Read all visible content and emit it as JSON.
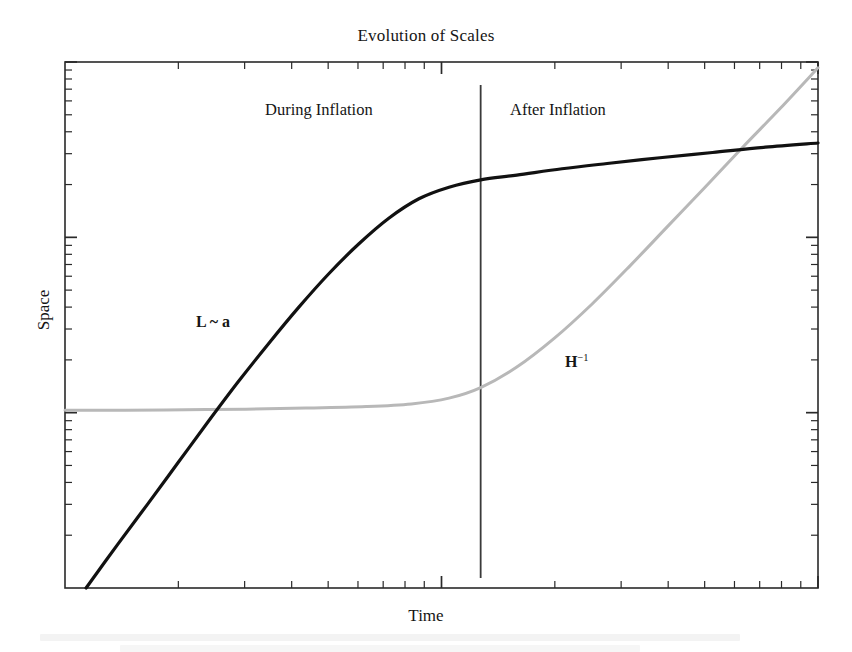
{
  "figure": {
    "title": "Evolution of Scales",
    "xlabel": "Time",
    "ylabel": "Space",
    "region_left_label": "During Inflation",
    "region_right_label": "After Inflation",
    "curve_label_scale": "L ~ a",
    "curve_label_hubble_base": "H",
    "curve_label_hubble_exponent": "−1"
  },
  "chart_data": {
    "type": "line",
    "title": "Evolution of Scales",
    "xlabel": "Time",
    "ylabel": "Space",
    "grid": false,
    "legend": "none",
    "xscale": "log",
    "yscale": "log",
    "xlim": [
      0,
      1
    ],
    "ylim": [
      0,
      1
    ],
    "axis_tick_labels": [],
    "annotations": [
      {
        "text": "During Inflation",
        "x": 0.28,
        "y": 0.93
      },
      {
        "text": "After Inflation",
        "x": 0.62,
        "y": 0.93
      },
      {
        "text": "L ~ a",
        "x": 0.19,
        "y": 0.53
      },
      {
        "text": "H−1",
        "x": 0.68,
        "y": 0.45
      }
    ],
    "reference_lines": [
      {
        "orientation": "vertical",
        "x": 0.552,
        "label": "end of inflation"
      }
    ],
    "series": [
      {
        "name": "L ~ a",
        "color": "#111111",
        "width": 3.2,
        "points": [
          [
            0.028,
            0.0
          ],
          [
            0.07,
            0.083
          ],
          [
            0.11,
            0.16
          ],
          [
            0.15,
            0.238
          ],
          [
            0.19,
            0.316
          ],
          [
            0.23,
            0.392
          ],
          [
            0.27,
            0.464
          ],
          [
            0.31,
            0.533
          ],
          [
            0.35,
            0.597
          ],
          [
            0.39,
            0.654
          ],
          [
            0.43,
            0.703
          ],
          [
            0.47,
            0.74
          ],
          [
            0.51,
            0.762
          ],
          [
            0.552,
            0.776
          ],
          [
            0.6,
            0.785
          ],
          [
            0.66,
            0.797
          ],
          [
            0.72,
            0.807
          ],
          [
            0.79,
            0.818
          ],
          [
            0.86,
            0.828
          ],
          [
            0.93,
            0.838
          ],
          [
            1.0,
            0.846
          ]
        ]
      },
      {
        "name": "H−1",
        "color": "#b8b8b8",
        "width": 3.0,
        "points": [
          [
            0.0,
            0.338
          ],
          [
            0.08,
            0.338
          ],
          [
            0.16,
            0.339
          ],
          [
            0.24,
            0.34
          ],
          [
            0.32,
            0.342
          ],
          [
            0.4,
            0.345
          ],
          [
            0.46,
            0.35
          ],
          [
            0.51,
            0.361
          ],
          [
            0.552,
            0.381
          ],
          [
            0.6,
            0.42
          ],
          [
            0.65,
            0.475
          ],
          [
            0.7,
            0.54
          ],
          [
            0.75,
            0.612
          ],
          [
            0.8,
            0.687
          ],
          [
            0.85,
            0.762
          ],
          [
            0.9,
            0.838
          ],
          [
            0.95,
            0.912
          ],
          [
            1.0,
            0.989
          ]
        ]
      }
    ],
    "intersections": [
      {
        "x": 0.228,
        "y": 0.338
      },
      {
        "x": 0.83,
        "y": 0.822
      }
    ]
  }
}
